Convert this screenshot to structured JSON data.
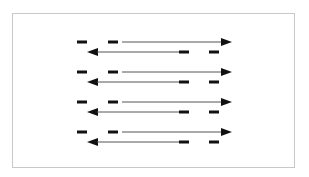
{
  "diagram": {
    "frame": {
      "border_color": "#c8c8c8",
      "background": "#ffffff"
    },
    "colors": {
      "line": "#555555",
      "dash": "#111111",
      "arrowhead": "#111111"
    },
    "rows": [
      {
        "index": 1,
        "top_y": 42,
        "bottom_y": 52
      },
      {
        "index": 2,
        "top_y": 72,
        "bottom_y": 82
      },
      {
        "index": 3,
        "top_y": 102,
        "bottom_y": 112
      },
      {
        "index": 4,
        "top_y": 132,
        "bottom_y": 142
      }
    ],
    "top_arrow": {
      "dash_1": [
        77,
        87
      ],
      "dash_2": [
        108,
        118
      ],
      "line_start": 122,
      "tip": 232,
      "direction": "right"
    },
    "bottom_arrow": {
      "tip": 87,
      "line_end": 179,
      "dash_1": [
        179,
        189
      ],
      "dash_2": [
        209,
        219
      ],
      "direction": "left"
    }
  }
}
